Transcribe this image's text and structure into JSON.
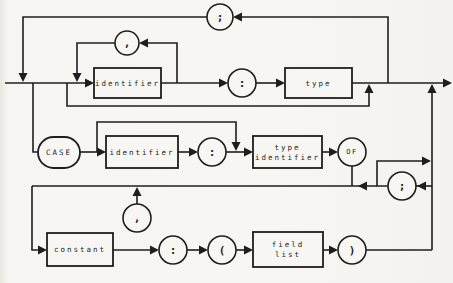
{
  "diagram": {
    "canvas": {
      "width": 453,
      "height": 283
    },
    "colors": {
      "paper": "#f7f6f2",
      "ink": "#1e1e1e"
    },
    "nodes": [
      {
        "id": "semicolon-top",
        "shape": "circle",
        "label": ";",
        "cx": 220,
        "cy": 17,
        "r": 13
      },
      {
        "id": "comma-top",
        "shape": "circle",
        "label": ",",
        "cx": 127,
        "cy": 43,
        "r": 12
      },
      {
        "id": "identifier-1",
        "shape": "rect",
        "label": "identifier",
        "x": 94,
        "y": 68,
        "w": 67,
        "h": 30
      },
      {
        "id": "colon-1",
        "shape": "circle",
        "label": ":",
        "cx": 242,
        "cy": 83,
        "r": 14
      },
      {
        "id": "type",
        "shape": "rect",
        "label": "type",
        "x": 285,
        "y": 68,
        "w": 67,
        "h": 30
      },
      {
        "id": "case",
        "shape": "oval",
        "label": "CASE",
        "x": 38,
        "y": 137,
        "w": 42,
        "h": 31
      },
      {
        "id": "identifier-2",
        "shape": "rect",
        "label": "identifier",
        "x": 106,
        "y": 136,
        "w": 72,
        "h": 32
      },
      {
        "id": "colon-2",
        "shape": "circle",
        "label": ":",
        "cx": 212,
        "cy": 152,
        "r": 14
      },
      {
        "id": "type-identifier",
        "shape": "rect",
        "label": "type identifier",
        "lines": [
          "type",
          "identifier"
        ],
        "x": 253,
        "y": 136,
        "w": 69,
        "h": 32
      },
      {
        "id": "of",
        "shape": "circle",
        "label": "OF",
        "cx": 352,
        "cy": 152,
        "r": 14
      },
      {
        "id": "semicolon-right",
        "shape": "circle",
        "label": ";",
        "cx": 402,
        "cy": 186,
        "r": 14
      },
      {
        "id": "comma-bottom",
        "shape": "circle",
        "label": ",",
        "cx": 137,
        "cy": 218,
        "r": 14
      },
      {
        "id": "constant",
        "shape": "rect",
        "label": "constant",
        "x": 47,
        "y": 233,
        "w": 66,
        "h": 33
      },
      {
        "id": "colon-3",
        "shape": "circle",
        "label": ":",
        "cx": 173,
        "cy": 250,
        "r": 14
      },
      {
        "id": "open-paren",
        "shape": "circle",
        "label": "(",
        "cx": 222,
        "cy": 250,
        "r": 14
      },
      {
        "id": "field-list",
        "shape": "rect",
        "label": "field list",
        "lines": [
          "field",
          "list"
        ],
        "x": 253,
        "y": 232,
        "w": 70,
        "h": 35
      },
      {
        "id": "close-paren",
        "shape": "circle",
        "label": ")",
        "cx": 352,
        "cy": 250,
        "r": 14
      }
    ],
    "edges": [
      {
        "name": "entry-line",
        "pts": [
          [
            5,
            83
          ],
          [
            87,
            83
          ]
        ]
      },
      {
        "name": "semicolon-loop-left",
        "pts": [
          [
            207,
            17
          ],
          [
            23,
            17
          ],
          [
            23,
            75
          ]
        ]
      },
      {
        "name": "semicolon-loop-right",
        "pts": [
          [
            242,
            17
          ],
          [
            388,
            17
          ],
          [
            388,
            83
          ]
        ]
      },
      {
        "name": "comma-top-right-leg",
        "pts": [
          [
            177,
            83
          ],
          [
            177,
            43
          ],
          [
            147,
            43
          ]
        ]
      },
      {
        "name": "comma-top-left-leg",
        "pts": [
          [
            115,
            43
          ],
          [
            77,
            43
          ],
          [
            77,
            75
          ]
        ]
      },
      {
        "name": "empty-bypass",
        "pts": [
          [
            67,
            83
          ],
          [
            67,
            106
          ],
          [
            369,
            106
          ],
          [
            369,
            92
          ]
        ]
      },
      {
        "name": "identifier1-out",
        "pts": [
          [
            161,
            83
          ],
          [
            220,
            83
          ]
        ]
      },
      {
        "name": "colon1-out",
        "pts": [
          [
            256,
            83
          ],
          [
            277,
            83
          ]
        ]
      },
      {
        "name": "type-out-exit",
        "pts": [
          [
            352,
            83
          ],
          [
            444,
            83
          ]
        ]
      },
      {
        "name": "case-drop",
        "pts": [
          [
            33,
            83
          ],
          [
            33,
            152
          ],
          [
            38,
            152
          ]
        ]
      },
      {
        "name": "case-out",
        "pts": [
          [
            80,
            152
          ],
          [
            98,
            152
          ]
        ]
      },
      {
        "name": "tag-bypass",
        "pts": [
          [
            97,
            152
          ],
          [
            97,
            122
          ],
          [
            236,
            122
          ],
          [
            236,
            143
          ]
        ]
      },
      {
        "name": "identifier2-out",
        "pts": [
          [
            178,
            152
          ],
          [
            190,
            152
          ]
        ]
      },
      {
        "name": "colon2-out",
        "pts": [
          [
            226,
            152
          ],
          [
            245,
            152
          ]
        ]
      },
      {
        "name": "type-identifier-out",
        "pts": [
          [
            322,
            152
          ],
          [
            330,
            152
          ]
        ]
      },
      {
        "name": "of-drop",
        "pts": [
          [
            352,
            166
          ],
          [
            352,
            186
          ]
        ]
      },
      {
        "name": "variant-return-line",
        "pts": [
          [
            32,
            186
          ],
          [
            388,
            186
          ]
        ]
      },
      {
        "name": "semicolon-right-in",
        "pts": [
          [
            416,
            186
          ],
          [
            432,
            186
          ]
        ]
      },
      {
        "name": "variant-exit-branch",
        "pts": [
          [
            377,
            186
          ],
          [
            377,
            161
          ],
          [
            423,
            161
          ]
        ]
      },
      {
        "name": "right-vertical",
        "pts": [
          [
            432,
            92
          ],
          [
            432,
            250
          ]
        ]
      },
      {
        "name": "variant-entry-drop",
        "pts": [
          [
            32,
            186
          ],
          [
            32,
            250
          ],
          [
            39,
            250
          ]
        ]
      },
      {
        "name": "comma-bottom-stem",
        "pts": [
          [
            137,
            195
          ],
          [
            137,
            204
          ]
        ]
      },
      {
        "name": "constant-out",
        "pts": [
          [
            113,
            250
          ],
          [
            151,
            250
          ]
        ]
      },
      {
        "name": "colon3-out",
        "pts": [
          [
            187,
            250
          ],
          [
            200,
            250
          ]
        ]
      },
      {
        "name": "open-paren-out",
        "pts": [
          [
            236,
            250
          ],
          [
            245,
            250
          ]
        ]
      },
      {
        "name": "field-list-out",
        "pts": [
          [
            323,
            250
          ],
          [
            330,
            250
          ]
        ]
      },
      {
        "name": "close-paren-out",
        "pts": [
          [
            366,
            250
          ],
          [
            432,
            250
          ]
        ]
      }
    ],
    "arrows": [
      {
        "name": "into-semicolon-top",
        "tip": [
          233,
          17
        ],
        "dir": "left"
      },
      {
        "name": "semicolon-loop-merge",
        "tip": [
          23,
          82
        ],
        "dir": "down"
      },
      {
        "name": "into-comma-top",
        "tip": [
          139,
          43
        ],
        "dir": "left"
      },
      {
        "name": "comma-loop-merge",
        "tip": [
          77,
          82
        ],
        "dir": "down"
      },
      {
        "name": "into-identifier-1",
        "tip": [
          94,
          83
        ],
        "dir": "right"
      },
      {
        "name": "into-colon-1",
        "tip": [
          228,
          83
        ],
        "dir": "right"
      },
      {
        "name": "into-type",
        "tip": [
          285,
          83
        ],
        "dir": "right"
      },
      {
        "name": "bypass-merge",
        "tip": [
          369,
          84
        ],
        "dir": "up"
      },
      {
        "name": "variant-exit-merge",
        "tip": [
          432,
          84
        ],
        "dir": "up"
      },
      {
        "name": "exit-arrow",
        "tip": [
          452,
          83
        ],
        "dir": "right"
      },
      {
        "name": "into-identifier-2",
        "tip": [
          106,
          152
        ],
        "dir": "right"
      },
      {
        "name": "into-colon-2",
        "tip": [
          198,
          152
        ],
        "dir": "right"
      },
      {
        "name": "tag-bypass-merge",
        "tip": [
          236,
          151
        ],
        "dir": "down"
      },
      {
        "name": "into-type-identifier",
        "tip": [
          253,
          152
        ],
        "dir": "right"
      },
      {
        "name": "into-of",
        "tip": [
          338,
          152
        ],
        "dir": "right"
      },
      {
        "name": "variant-return-arrow",
        "tip": [
          358,
          186
        ],
        "dir": "left"
      },
      {
        "name": "into-semicolon-right",
        "tip": [
          417,
          186
        ],
        "dir": "left"
      },
      {
        "name": "variant-exit-arrow",
        "tip": [
          431,
          161
        ],
        "dir": "right"
      },
      {
        "name": "comma-bottom-merge",
        "tip": [
          137,
          187
        ],
        "dir": "up"
      },
      {
        "name": "into-constant",
        "tip": [
          47,
          250
        ],
        "dir": "right"
      },
      {
        "name": "into-colon-3",
        "tip": [
          159,
          250
        ],
        "dir": "right"
      },
      {
        "name": "into-open-paren",
        "tip": [
          208,
          250
        ],
        "dir": "right"
      },
      {
        "name": "into-field-list",
        "tip": [
          253,
          250
        ],
        "dir": "right"
      },
      {
        "name": "into-close-paren",
        "tip": [
          338,
          250
        ],
        "dir": "right"
      }
    ]
  }
}
